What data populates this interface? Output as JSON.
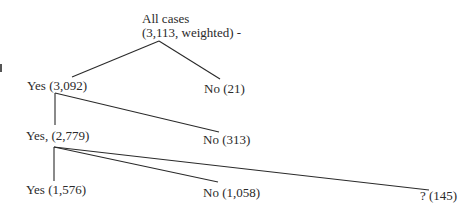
{
  "diagram": {
    "type": "tree",
    "root": {
      "label_line1": "All cases",
      "label_line2": "(3,113, weighted) -"
    },
    "level1": {
      "yes": "Yes (3,092)",
      "no": "No (21)"
    },
    "level2": {
      "yes": "Yes, (2,779)",
      "no": "No (313)"
    },
    "level3": {
      "yes": "Yes (1,576)",
      "no": "No (1,058)",
      "unknown": "? (145)"
    },
    "edges": [
      {
        "from": "All cases",
        "to": "Yes (3,092)"
      },
      {
        "from": "All cases",
        "to": "No (21)"
      },
      {
        "from": "Yes (3,092)",
        "to": "Yes, (2,779)"
      },
      {
        "from": "Yes (3,092)",
        "to": "No (313)"
      },
      {
        "from": "Yes, (2,779)",
        "to": "Yes (1,576)"
      },
      {
        "from": "Yes, (2,779)",
        "to": "No (1,058)"
      },
      {
        "from": "Yes, (2,779)",
        "to": "? (145)"
      }
    ]
  }
}
